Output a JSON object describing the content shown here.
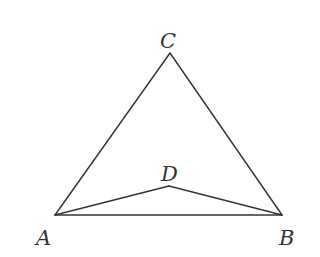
{
  "diagram": {
    "type": "geometry",
    "stroke_color": "#333333",
    "points": {
      "A": {
        "label": "A",
        "x": 55,
        "y": 215,
        "label_x": 36,
        "label_y": 245
      },
      "B": {
        "label": "B",
        "x": 282,
        "y": 215,
        "label_x": 279,
        "label_y": 245
      },
      "C": {
        "label": "C",
        "x": 170,
        "y": 53,
        "label_x": 160,
        "label_y": 48
      },
      "D": {
        "label": "D",
        "x": 169,
        "y": 186,
        "label_x": 161,
        "label_y": 181
      }
    },
    "segments": [
      {
        "from": "A",
        "to": "C"
      },
      {
        "from": "C",
        "to": "B"
      },
      {
        "from": "A",
        "to": "B"
      },
      {
        "from": "A",
        "to": "D"
      },
      {
        "from": "D",
        "to": "B"
      }
    ]
  }
}
